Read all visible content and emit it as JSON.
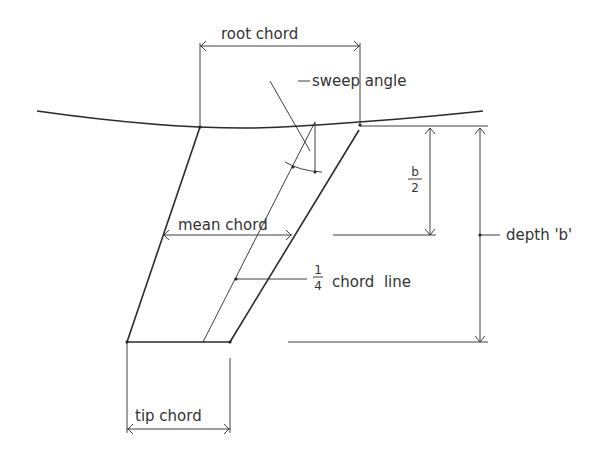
{
  "diagram": {
    "type": "swept wing planform geometry",
    "labels": {
      "root_chord": "root chord",
      "sweep_angle": "sweep angle",
      "mean_chord": "mean chord",
      "half_span_num": "b",
      "half_span_den": "2",
      "depth": "depth 'b'",
      "quarter_num": "1",
      "quarter_den": "4",
      "quarter_chord_line": "chord  line",
      "tip_chord": "tip chord"
    },
    "colors": {
      "line": "#2a2a2a",
      "text": "#333333",
      "background": "#ffffff"
    }
  }
}
